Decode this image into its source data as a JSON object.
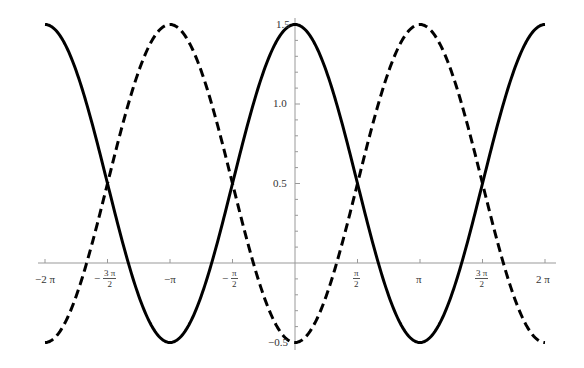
{
  "chart_data": {
    "type": "line",
    "title": "",
    "xlabel": "",
    "ylabel": "",
    "xlim": [
      -6.2832,
      6.2832
    ],
    "ylim": [
      -0.5,
      1.5
    ],
    "grid": false,
    "legend": null,
    "x_ticks": [
      "-2π",
      "-3π/2",
      "-π",
      "-π/2",
      "π/2",
      "π",
      "3π/2",
      "2π"
    ],
    "y_ticks": [
      "-0.5",
      "0.5",
      "1.0",
      "1.5"
    ],
    "series": [
      {
        "name": "0.5 + cos(x)",
        "style": "solid",
        "color": "#000000",
        "x": [
          -6.2832,
          -4.7124,
          -3.1416,
          -1.5708,
          0,
          1.5708,
          3.1416,
          4.7124,
          6.2832
        ],
        "values": [
          1.5,
          0.5,
          -0.5,
          0.5,
          1.5,
          0.5,
          -0.5,
          0.5,
          1.5
        ]
      },
      {
        "name": "0.5 - cos(x)",
        "style": "dashed",
        "color": "#000000",
        "x": [
          -6.2832,
          -4.7124,
          -3.1416,
          -1.5708,
          0,
          1.5708,
          3.1416,
          4.7124,
          6.2832
        ],
        "values": [
          -0.5,
          0.5,
          1.5,
          0.5,
          -0.5,
          0.5,
          1.5,
          0.5,
          -0.5
        ]
      }
    ]
  },
  "labels": {
    "x": {
      "m2pi": "−2 π",
      "m3pi2_num": "3 π",
      "m3pi2_den": "2",
      "mpi": "−π",
      "mpi2_num": "π",
      "mpi2_den": "2",
      "pi2_num": "π",
      "pi2_den": "2",
      "pi": "π",
      "pi32_num": "3 π",
      "pi32_den": "2",
      "p2pi": "2 π",
      "minus": "−"
    },
    "y": {
      "m05": "−0.5",
      "p05": "0.5",
      "p10": "1.0",
      "p15": "1.5"
    }
  }
}
